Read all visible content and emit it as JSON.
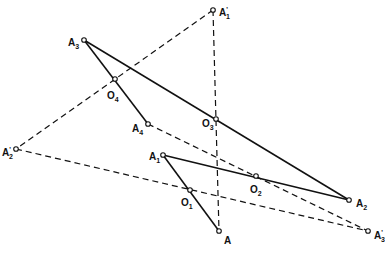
{
  "diagram": {
    "type": "geometric-construction",
    "points": [
      {
        "id": "A1p",
        "label": "A",
        "sup": "'",
        "sub": "1",
        "x": 213,
        "y": 10,
        "lx": 219,
        "ly": 16
      },
      {
        "id": "A3",
        "label": "A",
        "sup": "",
        "sub": "3",
        "x": 84,
        "y": 40,
        "lx": 68,
        "ly": 46
      },
      {
        "id": "O4",
        "label": "O",
        "sup": "",
        "sub": "4",
        "x": 115,
        "y": 79,
        "lx": 107,
        "ly": 99
      },
      {
        "id": "A4",
        "label": "A",
        "sup": "",
        "sub": "4",
        "x": 148,
        "y": 124,
        "lx": 132,
        "ly": 132
      },
      {
        "id": "O3",
        "label": "O",
        "sup": "",
        "sub": "3",
        "x": 216,
        "y": 119,
        "lx": 202,
        "ly": 127
      },
      {
        "id": "A2p",
        "label": "A",
        "sup": "'",
        "sub": "2",
        "x": 16,
        "y": 149,
        "lx": 2,
        "ly": 156
      },
      {
        "id": "A1",
        "label": "A",
        "sup": "",
        "sub": "1",
        "x": 163,
        "y": 155,
        "lx": 149,
        "ly": 160
      },
      {
        "id": "O2",
        "label": "O",
        "sup": "",
        "sub": "2",
        "x": 256,
        "y": 176,
        "lx": 250,
        "ly": 193
      },
      {
        "id": "O1",
        "label": "O",
        "sup": "",
        "sub": "1",
        "x": 190,
        "y": 190,
        "lx": 181,
        "ly": 206
      },
      {
        "id": "A",
        "label": "A",
        "sup": "",
        "sub": "",
        "x": 219,
        "y": 231,
        "lx": 224,
        "ly": 244
      },
      {
        "id": "A2",
        "label": "A",
        "sup": "",
        "sub": "2",
        "x": 349,
        "y": 200,
        "lx": 356,
        "ly": 207
      },
      {
        "id": "A3p",
        "label": "A",
        "sup": "'",
        "sub": "3",
        "x": 368,
        "y": 231,
        "lx": 374,
        "ly": 239
      }
    ],
    "solid_segments": [
      [
        "A3",
        "A2"
      ],
      [
        "A3",
        "A4"
      ],
      [
        "A1",
        "A2"
      ],
      [
        "A1",
        "A"
      ]
    ],
    "dashed_segments": [
      [
        "A1p",
        "A2p"
      ],
      [
        "A1p",
        "A"
      ],
      [
        "A4",
        "A3p"
      ],
      [
        "A2p",
        "A3p"
      ]
    ]
  }
}
